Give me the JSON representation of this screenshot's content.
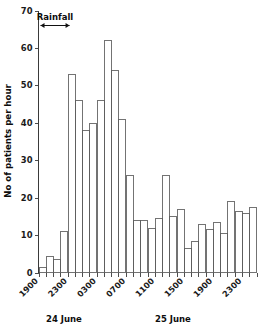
{
  "chart_data": {
    "type": "bar",
    "title": "",
    "xlabel": "",
    "ylabel": "No of patients per hour",
    "ylim": [
      0,
      70
    ],
    "yticks": [
      0,
      10,
      20,
      30,
      40,
      50,
      60,
      70
    ],
    "ytick_labels": [
      "0",
      "10",
      "20",
      "30",
      "40",
      "50",
      "60",
      "70"
    ],
    "grid": false,
    "legend": "none",
    "categories": [
      "1900",
      "2000",
      "2100",
      "2200",
      "2300",
      "2400",
      "0100",
      "0200",
      "0300",
      "0400",
      "0500",
      "0600",
      "0700",
      "0800",
      "0900",
      "1000",
      "1100",
      "1200",
      "1300",
      "1400",
      "1500",
      "1600",
      "1700",
      "1800",
      "1900",
      "2000",
      "2100",
      "2200",
      "2300",
      "2400"
    ],
    "values": [
      1.5,
      4.5,
      3.5,
      11,
      53,
      46,
      38,
      40,
      46,
      62,
      54,
      41,
      26,
      14,
      14,
      12,
      14.5,
      26,
      15,
      17,
      6.5,
      8.5,
      13,
      11.5,
      13.5,
      10.5,
      19,
      16.5,
      16,
      17.5
    ],
    "xtick_labels": [
      "1900",
      "2300",
      "0300",
      "0700",
      "1100",
      "1500",
      "1900",
      "2300"
    ],
    "xtick_categories": [
      "1900",
      "2300",
      "0300",
      "0700",
      "1100",
      "1500",
      "1900",
      "2300"
    ],
    "day_labels": [
      {
        "text": "24 June",
        "center_category": "2200"
      },
      {
        "text": "25 June",
        "center_category": "1300"
      }
    ],
    "annotations": [
      {
        "type": "span-arrow",
        "label": "Rainfall",
        "start_category": "1900",
        "end_category": "2300",
        "y_value": 66
      }
    ],
    "colors": {
      "bar_face": "#ffffff",
      "bar_edge": "#5b5b5b",
      "axis": "#3a3a3a",
      "text": "#0d0d0d",
      "annotation": "#111111"
    }
  }
}
